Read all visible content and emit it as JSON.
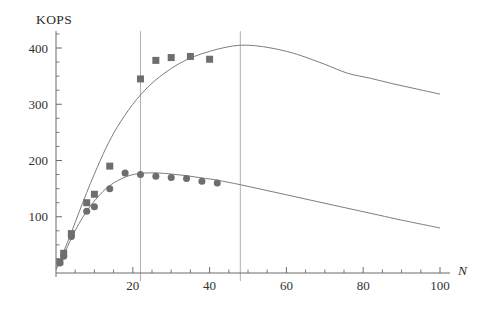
{
  "chart_data": {
    "type": "scatter",
    "title": "KOPS",
    "xlabel": "N",
    "ylabel": "KOPS",
    "xlim": [
      0,
      104
    ],
    "ylim": [
      0,
      430
    ],
    "grid": false,
    "legend": "none",
    "x_ticks_major": [
      20,
      40,
      60,
      80,
      100
    ],
    "x_tick_labels": [
      "20",
      "40",
      "60",
      "80",
      "100"
    ],
    "x_ticks_minor": [
      5,
      10,
      15,
      25,
      30,
      35,
      45,
      50,
      55,
      65,
      70,
      75,
      85,
      90,
      95
    ],
    "y_ticks_major": [
      100,
      200,
      300,
      400
    ],
    "y_tick_labels": [
      "100",
      "200",
      "300",
      "400"
    ],
    "y_ticks_minor": [
      25,
      50,
      75,
      125,
      150,
      175,
      225,
      250,
      275,
      325,
      350,
      375,
      425
    ],
    "marker_color": "#6e6e6e",
    "curve_color": "#7d7d7d",
    "axis_color": "#6b6b6b",
    "vline_color": "#9a9a9a",
    "vertical_reference_lines": [
      22,
      48
    ],
    "series": [
      {
        "name": "upper",
        "marker": "square",
        "marker_size": 7,
        "x": [
          1,
          2,
          4,
          8,
          10,
          14,
          22,
          26,
          30,
          35,
          40
        ],
        "values": [
          20,
          35,
          70,
          125,
          140,
          190,
          345,
          378,
          383,
          385,
          380
        ]
      },
      {
        "name": "lower",
        "marker": "circle",
        "marker_size": 7,
        "x": [
          1,
          2,
          4,
          8,
          10,
          14,
          18,
          22,
          26,
          30,
          34,
          38,
          42
        ],
        "values": [
          18,
          30,
          65,
          110,
          118,
          150,
          178,
          175,
          172,
          170,
          168,
          163,
          160
        ]
      }
    ],
    "fit_curves": [
      {
        "name": "upper-fit",
        "x": [
          0,
          2,
          4,
          6,
          8,
          10,
          13,
          16,
          20,
          24,
          28,
          32,
          36,
          40,
          44,
          48,
          52,
          56,
          60,
          64,
          70,
          76,
          82,
          88,
          94,
          100
        ],
        "values": [
          8,
          38,
          72,
          108,
          143,
          176,
          222,
          260,
          300,
          331,
          354,
          372,
          385,
          394,
          401,
          405,
          404,
          400,
          394,
          386,
          371,
          355,
          346,
          336,
          327,
          318
        ]
      },
      {
        "name": "lower-fit",
        "x": [
          0,
          2,
          4,
          6,
          8,
          10,
          13,
          16,
          19,
          22,
          26,
          30,
          34,
          38,
          42,
          48,
          54,
          60,
          66,
          72,
          78,
          84,
          90,
          95,
          100
        ],
        "values": [
          6,
          32,
          62,
          88,
          110,
          128,
          150,
          164,
          173,
          177,
          178,
          176,
          173,
          169,
          165,
          157,
          148,
          139,
          130,
          121,
          112,
          103,
          94,
          87,
          80
        ]
      }
    ]
  }
}
